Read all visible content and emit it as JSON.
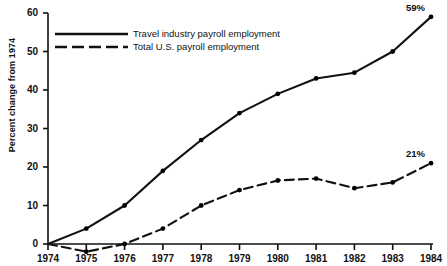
{
  "chart_data": {
    "type": "line",
    "title": "",
    "xlabel": "",
    "ylabel": "Percent change from 1974",
    "x": [
      1974,
      1975,
      1976,
      1977,
      1978,
      1979,
      1980,
      1981,
      1982,
      1983,
      1984
    ],
    "xticklabels": [
      "1974",
      "1975",
      "1976",
      "1977",
      "1978",
      "1979",
      "1980",
      "1981",
      "1982",
      "1983",
      "1984"
    ],
    "yticks": [
      0,
      10,
      20,
      30,
      40,
      50,
      60
    ],
    "yticklabels": [
      "0",
      "10",
      "20",
      "30",
      "40",
      "50",
      "60"
    ],
    "ylim": [
      -4,
      62
    ],
    "xlim": [
      1974,
      1984
    ],
    "grid": false,
    "legend_position": "upper-left-inside",
    "series": [
      {
        "name": "Travel industry payroll employment",
        "style": "solid",
        "color": "#000000",
        "marker": "dot",
        "values": [
          0,
          4,
          10,
          19,
          27,
          34,
          39,
          43,
          44.5,
          50,
          59
        ],
        "end_label": "59%"
      },
      {
        "name": "Total U.S. payroll employment",
        "style": "dashed",
        "color": "#000000",
        "marker": "dot",
        "values": [
          0,
          -2,
          0,
          4,
          10,
          14,
          16.5,
          17,
          14.5,
          16,
          21
        ],
        "end_label": "21%"
      }
    ],
    "annotations": [
      {
        "text": "59%",
        "series": "Travel industry payroll employment",
        "x": 1984,
        "y": 59
      },
      {
        "text": "21%",
        "series": "Total U.S. payroll employment",
        "x": 1984,
        "y": 21
      }
    ]
  },
  "legend": {
    "items": [
      {
        "label": "Travel industry payroll employment",
        "style": "solid"
      },
      {
        "label": "Total U.S. payroll employment",
        "style": "dashed"
      }
    ]
  },
  "axes": {
    "y_title": "Percent change from 1974"
  }
}
